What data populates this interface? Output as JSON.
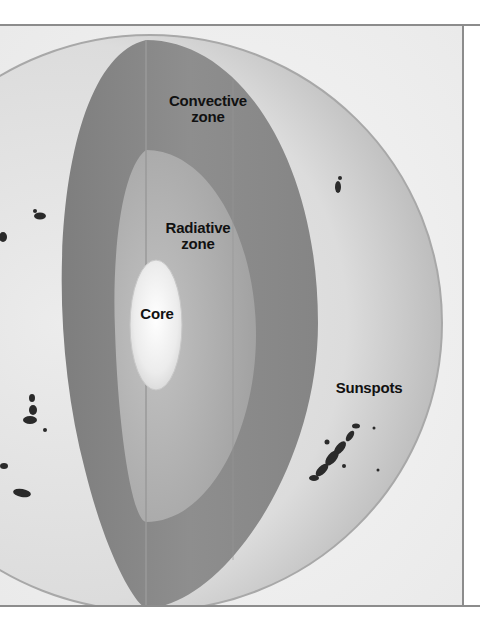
{
  "figure": {
    "labels": {
      "convective_zone": "Convective\nzone",
      "convective_zone_line1": "Convective",
      "convective_zone_line2": "zone",
      "radiative_zone_line1": "Radiative",
      "radiative_zone_line2": "zone",
      "core": "Core",
      "sunspots": "Sunspots"
    },
    "colors": {
      "background": "#ffffff",
      "frame": "#8c8c8c",
      "photosphere": "#d2d2d2",
      "convective_zone": "#8a8a8a",
      "radiative_zone": "#a9a9a9",
      "core": "#f2f2f2",
      "sunspot": "#2a2a2a",
      "label_text": "#111111"
    }
  }
}
